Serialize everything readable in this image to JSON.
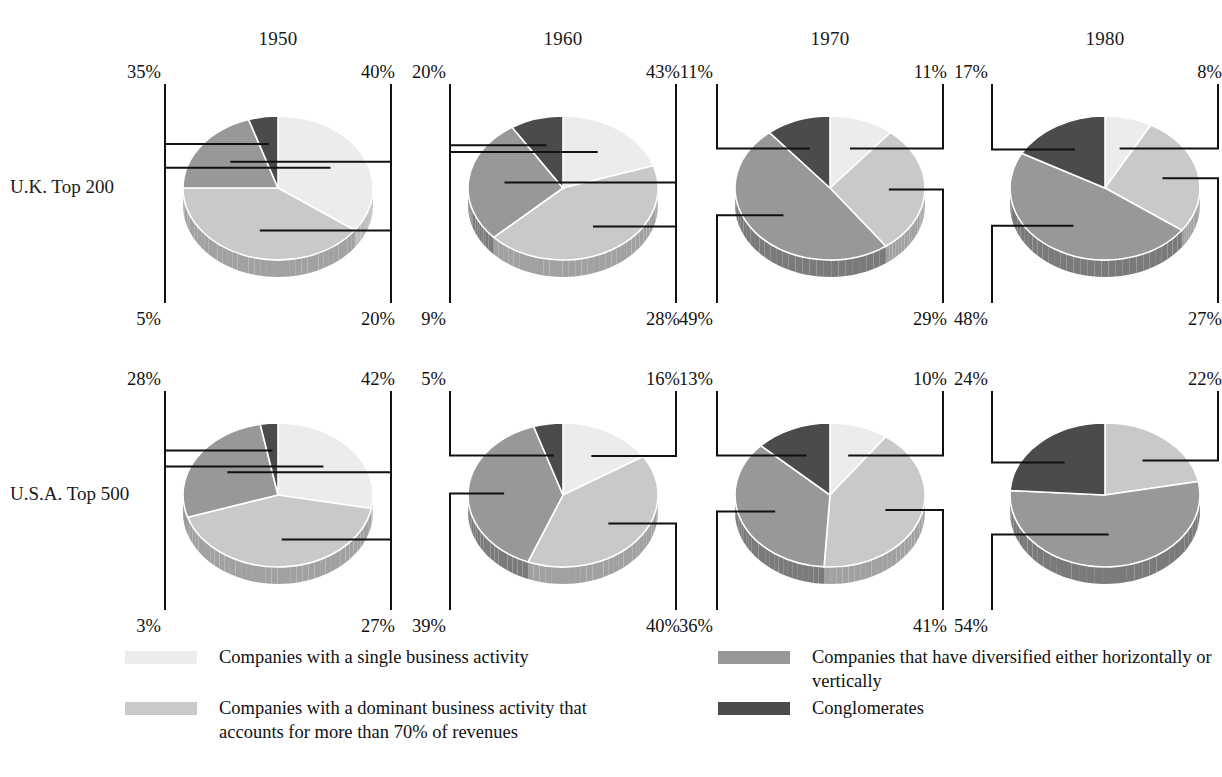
{
  "figure": {
    "row_labels": [
      "U.K. Top 200",
      "U.S.A. Top 500"
    ],
    "year_headers": [
      "1950",
      "1960",
      "1970",
      "1980"
    ]
  },
  "legend": {
    "items": [
      {
        "name": "single",
        "label": "Companies with a single business activity",
        "color": "#ececec"
      },
      {
        "name": "dominant",
        "label": "Companies with a dominant business activity that accounts for more than 70% of revenues",
        "color": "#c9c9c9"
      },
      {
        "name": "diversified",
        "label": "Companies that have diversified either horizontally or vertically",
        "color": "#989898"
      },
      {
        "name": "conglomerate",
        "label": "Conglomerates",
        "color": "#4b4b4b"
      }
    ]
  },
  "colors": {
    "single": "#ececec",
    "dominant": "#c9c9c9",
    "diversified": "#989898",
    "conglomerate": "#4b4b4b",
    "rim_single": "#d2d2d2",
    "rim_dominant": "#b0b0b0",
    "rim_diversified": "#848484",
    "rim_conglomerate": "#3a3a3a",
    "outline": "#ffffff",
    "callout": "#111111"
  },
  "chart_data": {
    "type": "pie",
    "unit": "%",
    "categories": [
      "Companies with a single business activity",
      "Companies with a dominant business activity that accounts for more than 70% of revenues",
      "Companies that have diversified either horizontally or vertically",
      "Conglomerates"
    ],
    "rows": [
      "U.K. Top 200",
      "U.S.A. Top 500"
    ],
    "columns": [
      "1950",
      "1960",
      "1970",
      "1980"
    ],
    "pies": [
      {
        "row": "U.K. Top 200",
        "year": "1950",
        "slices": [
          {
            "key": "single",
            "value": 35,
            "label": "35%"
          },
          {
            "key": "dominant",
            "value": 40,
            "label": "40%"
          },
          {
            "key": "diversified",
            "value": 20,
            "label": "20%"
          },
          {
            "key": "conglomerate",
            "value": 5,
            "label": "5%"
          }
        ]
      },
      {
        "row": "U.K. Top 200",
        "year": "1960",
        "slices": [
          {
            "key": "single",
            "value": 20,
            "label": "20%"
          },
          {
            "key": "dominant",
            "value": 43,
            "label": "43%"
          },
          {
            "key": "diversified",
            "value": 28,
            "label": "28%"
          },
          {
            "key": "conglomerate",
            "value": 9,
            "label": "9%"
          }
        ]
      },
      {
        "row": "U.K. Top 200",
        "year": "1970",
        "slices": [
          {
            "key": "single",
            "value": 11,
            "label": "11%"
          },
          {
            "key": "dominant",
            "value": 29,
            "label": "29%"
          },
          {
            "key": "diversified",
            "value": 49,
            "label": "49%"
          },
          {
            "key": "conglomerate",
            "value": 11,
            "label": "11%"
          }
        ]
      },
      {
        "row": "U.K. Top 200",
        "year": "1980",
        "slices": [
          {
            "key": "single",
            "value": 8,
            "label": "8%"
          },
          {
            "key": "dominant",
            "value": 27,
            "label": "27%"
          },
          {
            "key": "diversified",
            "value": 48,
            "label": "48%"
          },
          {
            "key": "conglomerate",
            "value": 17,
            "label": "17%"
          }
        ]
      },
      {
        "row": "U.S.A. Top 500",
        "year": "1950",
        "slices": [
          {
            "key": "single",
            "value": 28,
            "label": "28%"
          },
          {
            "key": "dominant",
            "value": 42,
            "label": "42%"
          },
          {
            "key": "diversified",
            "value": 27,
            "label": "27%"
          },
          {
            "key": "conglomerate",
            "value": 3,
            "label": "3%"
          }
        ]
      },
      {
        "row": "U.S.A. Top 500",
        "year": "1960",
        "slices": [
          {
            "key": "single",
            "value": 16,
            "label": "16%"
          },
          {
            "key": "dominant",
            "value": 40,
            "label": "40%"
          },
          {
            "key": "diversified",
            "value": 39,
            "label": "39%"
          },
          {
            "key": "conglomerate",
            "value": 5,
            "label": "5%"
          }
        ]
      },
      {
        "row": "U.S.A. Top 500",
        "year": "1970",
        "slices": [
          {
            "key": "single",
            "value": 10,
            "label": "10%"
          },
          {
            "key": "dominant",
            "value": 41,
            "label": "41%"
          },
          {
            "key": "diversified",
            "value": 36,
            "label": "36%"
          },
          {
            "key": "conglomerate",
            "value": 13,
            "label": "13%"
          }
        ]
      },
      {
        "row": "U.S.A. Top 500",
        "year": "1980",
        "slices": [
          {
            "key": "dominant",
            "value": 22,
            "label": "22%"
          },
          {
            "key": "diversified",
            "value": 54,
            "label": "54%"
          },
          {
            "key": "conglomerate",
            "value": 24,
            "label": "24%"
          }
        ]
      }
    ]
  },
  "layout": {
    "pie_centers_x": [
      278,
      563,
      830,
      1105
    ],
    "pie_centers_y": [
      188,
      495
    ],
    "year_label_y": 28,
    "row_label_x": 10,
    "rx": 95,
    "ry": 72,
    "depth": 17,
    "start_angle_deg": -90
  }
}
